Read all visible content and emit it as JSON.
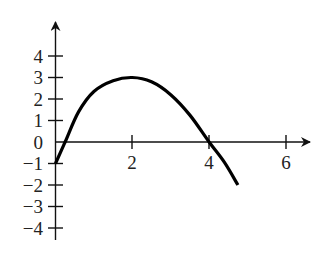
{
  "chart_data": {
    "type": "line",
    "xlabel": "",
    "ylabel": "y",
    "xlim": [
      0,
      6.2
    ],
    "ylim": [
      -4.5,
      5
    ],
    "grid": false,
    "legend": null,
    "x_ticks": [
      2,
      4,
      6
    ],
    "x_tick_labels": [
      "2",
      "4",
      "6"
    ],
    "y_ticks": [
      4,
      3,
      2,
      1,
      0,
      -1,
      -2,
      -3,
      -4
    ],
    "y_tick_labels": [
      "4",
      "3",
      "2",
      "1",
      "0",
      "−1",
      "−2",
      "−3",
      "−4"
    ],
    "series": [
      {
        "name": "f(x)",
        "x": [
          0,
          0.25,
          0.6,
          1.0,
          1.5,
          2.0,
          2.5,
          3.0,
          3.5,
          4.0,
          4.4,
          4.75
        ],
        "y": [
          -1,
          0,
          1.4,
          2.35,
          2.85,
          3.0,
          2.8,
          2.2,
          1.25,
          0,
          -0.95,
          -2.0
        ]
      }
    ],
    "annotations": {
      "maximum": [
        2,
        3
      ],
      "y_intercept": [
        0,
        -1
      ],
      "x_intercepts": [
        0.25,
        4
      ]
    }
  },
  "labels": {
    "x": [
      "2",
      "4",
      "6"
    ],
    "y": [
      "4",
      "3",
      "2",
      "1",
      "0",
      "−1",
      "−2",
      "−3",
      "−4"
    ]
  },
  "colors": {
    "curve": "#000000",
    "axis": "#111111",
    "text": "#222222"
  }
}
